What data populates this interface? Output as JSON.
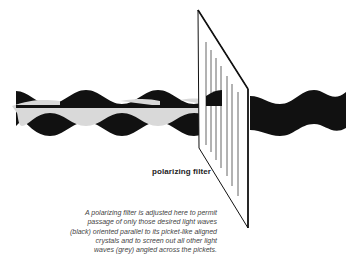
{
  "diagram": {
    "label": "polarizing filter",
    "caption_lines": [
      "A polarizing filter is adjusted here to permit",
      "passage of only those desired light waves",
      "(black) oriented parallel to its picket-like aligned",
      "crystals and to screen out all other light",
      "waves (grey) angled across the pickets."
    ],
    "colors": {
      "black_wave": "#111111",
      "grey_wave": "#d9d9d9",
      "background": "#ffffff"
    }
  }
}
